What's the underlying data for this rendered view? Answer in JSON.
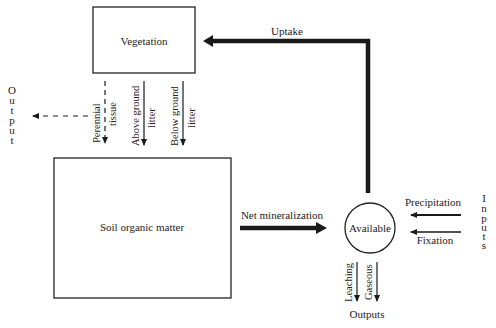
{
  "diagram": {
    "nodes": {
      "vegetation": {
        "label": "Vegetation"
      },
      "soil": {
        "label": "Soil organic matter"
      },
      "available": {
        "label": "Available"
      }
    },
    "flows": {
      "uptake": {
        "label": "Uptake"
      },
      "net_mineralization": {
        "label": "Net mineralization"
      },
      "perennial_tissue": {
        "line1": "Perennial",
        "line2": "tissue"
      },
      "above_ground_litter": {
        "line1": "Above ground",
        "line2": "litter"
      },
      "below_ground_litter": {
        "line1": "Below ground",
        "line2": "litter"
      },
      "precipitation": {
        "label": "Precipitation"
      },
      "fixation": {
        "label": "Fixation"
      },
      "leaching": {
        "label": "Leaching"
      },
      "gaseous": {
        "label": "Gaseous"
      }
    },
    "side_labels": {
      "output_left": [
        "O",
        "u",
        "t",
        "p",
        "u",
        "t"
      ],
      "inputs_right": [
        "I",
        "n",
        "p",
        "u",
        "t",
        "s"
      ],
      "outputs_bottom": "Outputs"
    },
    "colors": {
      "line": "#1a1a1a",
      "background": "#ffffff"
    }
  }
}
